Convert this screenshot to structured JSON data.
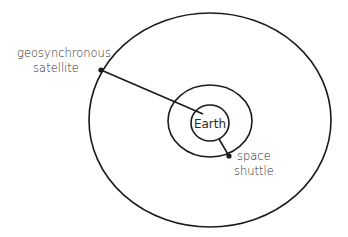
{
  "diagram": {
    "type": "orbit-diagram",
    "center": {
      "label": "Earth"
    },
    "labels": {
      "satellite_line1": "geosynchronous",
      "satellite_line2": "satellite",
      "shuttle_line1": "space",
      "shuttle_line2": "shuttle",
      "earth": "Earth"
    },
    "orbits": [
      {
        "name": "earth-surface",
        "cx": 210,
        "cy": 123,
        "rx": 19,
        "ry": 18
      },
      {
        "name": "shuttle-orbit",
        "cx": 210,
        "cy": 121,
        "rx": 42,
        "ry": 36
      },
      {
        "name": "geosynchronous-orbit",
        "cx": 210,
        "cy": 120,
        "rx": 121,
        "ry": 107
      }
    ],
    "colors": {
      "stroke": "#1a1a1a",
      "text": "#2a2a2a",
      "background": "#ffffff"
    }
  }
}
